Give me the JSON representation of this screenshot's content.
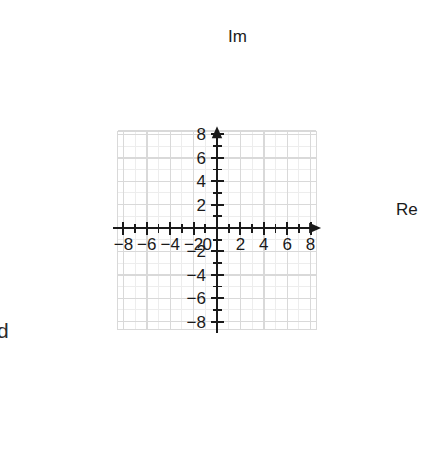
{
  "figure": {
    "title": "",
    "background_color": "#ffffff",
    "width": 435,
    "height": 451
  },
  "chart_data": {
    "type": "scatter",
    "title": "",
    "subtitle": "",
    "xlabel": "Re",
    "ylabel": "Im",
    "xlim": [
      -8.9,
      8.9
    ],
    "ylim": [
      -9.1,
      8.7
    ],
    "x": [],
    "y": [],
    "series": [],
    "grid": true,
    "grid_minor_step": 1,
    "grid_major_step": 2,
    "legend": false,
    "legend_position": "none",
    "xticks": [
      -8,
      -6,
      -4,
      -2,
      0,
      2,
      4,
      6,
      8
    ],
    "xtick_labels": [
      "−8",
      "−6",
      "−4",
      "−2",
      "0",
      "2",
      "4",
      "6",
      "8"
    ],
    "yticks": [
      -8,
      -6,
      -4,
      -2,
      2,
      4,
      6,
      8
    ],
    "ytick_labels": [
      "−8",
      "−6",
      "−4",
      "−2",
      "2",
      "4",
      "6",
      "8"
    ],
    "minor_tick_step": 1,
    "origin_label": "0",
    "axis_arrows": [
      "x-positive",
      "y-positive"
    ],
    "annotations": [
      {
        "text": "d",
        "position": "left-edge-clipped",
        "x_px": 2,
        "y_px": 330
      }
    ]
  },
  "style": {
    "axis_color": "#1a1a1a",
    "grid_minor_color": "#ededed",
    "grid_major_color": "#d9d9d9",
    "label_color": "#1a1a1a",
    "background_color": "#ffffff"
  },
  "axis_labels": {
    "real": "Re",
    "imaginary": "Im"
  }
}
